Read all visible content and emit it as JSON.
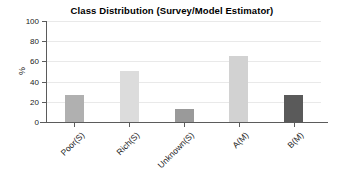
{
  "chart_data": {
    "type": "bar",
    "title": "Class Distribution (Survey/Model Estimator)",
    "xlabel": "",
    "ylabel": "%",
    "categories": [
      "Poor(S)",
      "Rich(S)",
      "Unknown(S)",
      "A(M)",
      "B(M)"
    ],
    "values": [
      27,
      51,
      13,
      65,
      27
    ],
    "colors": [
      "#b0b0b0",
      "#dcdcdc",
      "#9a9a9a",
      "#d2d2d2",
      "#5a5a5a"
    ],
    "ylim": [
      0,
      100
    ],
    "yticks": [
      0,
      20,
      40,
      60,
      80,
      100
    ],
    "ytick_labels": [
      "0",
      "20",
      "40",
      "60",
      "80",
      "100"
    ],
    "grid": true,
    "legend": false,
    "axis_color": "#5b5b5b",
    "grid_color": "#e9e9e9",
    "background": "#ffffff"
  }
}
